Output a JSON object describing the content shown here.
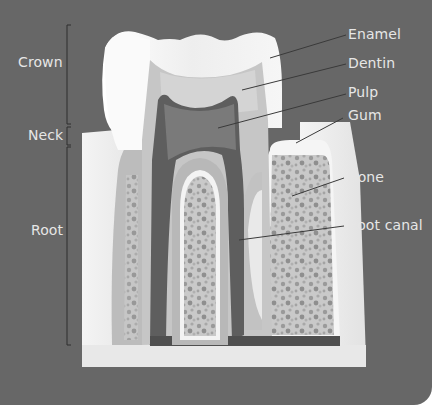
{
  "diagram": {
    "colors": {
      "background": "#676767",
      "page": "#ffffff",
      "label_text": "#e6e6e6",
      "enamel": "#f2f2f2",
      "dentin": "#c4c4c4",
      "pulp": "#6e6e6e",
      "gum": "#ececec",
      "bone": "#bdbdbd",
      "leader_line": "#3a3a3a"
    },
    "region_labels": [
      {
        "id": "crown",
        "text": "Crown"
      },
      {
        "id": "neck",
        "text": "Neck"
      },
      {
        "id": "root",
        "text": "Root"
      }
    ],
    "part_labels": [
      {
        "id": "enamel",
        "text": "Enamel"
      },
      {
        "id": "dentin",
        "text": "Dentin"
      },
      {
        "id": "pulp",
        "text": "Pulp"
      },
      {
        "id": "gum",
        "text": "Gum"
      },
      {
        "id": "bone",
        "text": "Bone"
      },
      {
        "id": "root-canal",
        "text": "Root canal"
      }
    ]
  }
}
